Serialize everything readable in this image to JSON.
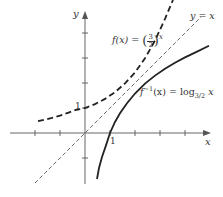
{
  "figure": {
    "axes": {
      "x_label": "x",
      "y_label": "y",
      "origin_px": [
        85,
        133
      ],
      "unit_px": 25,
      "x_ticks": [
        -2,
        -1,
        1,
        2,
        3,
        4
      ],
      "y_ticks": [
        -1,
        1,
        2,
        3,
        4
      ],
      "tick_label_x_one": "1",
      "tick_label_y_one": "1"
    },
    "curves": [
      {
        "name": "exponential",
        "style": "dashed-thick",
        "label": "f(x) = (3/2)^x",
        "label_parts": {
          "lhs": "f(x) = ",
          "num": "3",
          "den": "2",
          "exp": "x"
        }
      },
      {
        "name": "logarithm",
        "style": "solid-thick",
        "label": "f^-1(x) = log_{3/2} x",
        "label_parts": {
          "f": "f",
          "sup": "−1",
          "mid": "(x) = log",
          "sub": "3/2",
          "var": " x"
        }
      },
      {
        "name": "identity",
        "style": "dashed-thin",
        "label": "y = x"
      }
    ],
    "colors": {
      "ink": "#333333",
      "background": "#ffffff"
    }
  }
}
